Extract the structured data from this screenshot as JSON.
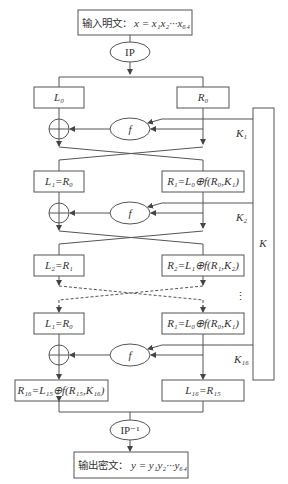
{
  "diagram": {
    "input": {
      "label_cn": "输入明文：",
      "formula": "x = x₁x₂···x₆₄"
    },
    "ip": {
      "label": "IP"
    },
    "ip_inv": {
      "label": "IP⁻¹"
    },
    "output": {
      "label_cn": "输出密文：",
      "formula": "y = y₁y₂···y₆₄"
    },
    "key_box": {
      "label": "K"
    },
    "f_label": "f",
    "rounds": [
      {
        "L": "L₀",
        "R": "R₀",
        "key": "K₁"
      },
      {
        "L": "L₁=R₀",
        "R": "R₁=L₀⊕f(R₀,K₁)",
        "key": "K₂"
      },
      {
        "L": "L₂=R₁",
        "R": "R₂=L₁⊕f(R₁,K₂)",
        "key": ""
      },
      {
        "L": "L₁=R₀",
        "R": "R₁=L₀⊕f(R₀,K₁)",
        "key": "K₁₆"
      }
    ],
    "final": {
      "left": "R₁₆=L₁₅⊕f(R₁₅,K₁₆)",
      "right": "L₁₆=R₁₅"
    },
    "ellipsis": "⋮"
  }
}
